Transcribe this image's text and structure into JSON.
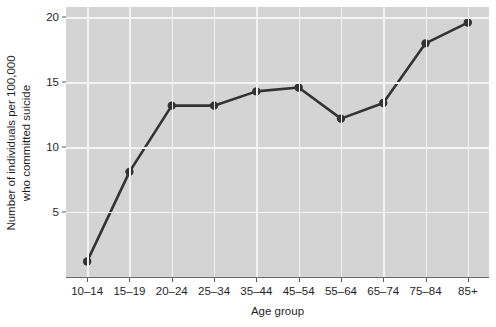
{
  "chart_data": {
    "type": "line",
    "title": "",
    "xlabel": "Age group",
    "ylabel_line1": "Number of individuals per 100,000",
    "ylabel_line2": "who committed suicide",
    "categories": [
      "10–14",
      "15–19",
      "20–24",
      "25–34",
      "35–44",
      "45–54",
      "55–64",
      "65–74",
      "75–84",
      "85+"
    ],
    "values": [
      1.2,
      8.1,
      13.2,
      13.2,
      14.3,
      14.6,
      12.2,
      13.4,
      18.0,
      19.6
    ],
    "series": [
      {
        "name": "Suicide rate",
        "values": [
          1.2,
          8.1,
          13.2,
          13.2,
          14.3,
          14.6,
          12.2,
          13.4,
          18.0,
          19.6
        ]
      }
    ],
    "ylim": [
      0,
      20.8
    ],
    "yticks": [
      5,
      10,
      15,
      20
    ],
    "ytick_labels": [
      "5",
      "10",
      "15",
      "20"
    ],
    "grid": true,
    "grid_major_y": [
      5,
      10,
      15,
      20
    ],
    "grid_major_x": true,
    "legend": "none",
    "panel_background": "#d4d4d4",
    "grid_color": "#f4f4f4",
    "line_color": "#333333",
    "point_color": "#333333",
    "marker": "circle"
  }
}
